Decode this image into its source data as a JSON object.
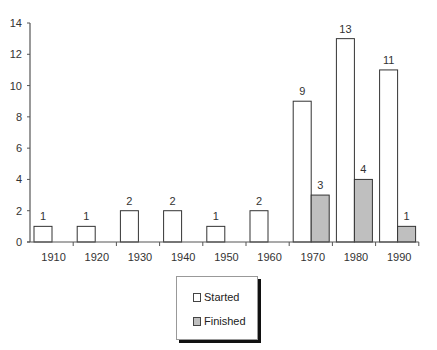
{
  "chart_data": {
    "type": "bar",
    "title": "",
    "xlabel": "",
    "ylabel": "",
    "categories": [
      "1910",
      "1920",
      "1930",
      "1940",
      "1950",
      "1960",
      "1970",
      "1980",
      "1990"
    ],
    "series": [
      {
        "name": "Started",
        "values": [
          1,
          1,
          2,
          2,
          1,
          2,
          9,
          13,
          11
        ],
        "color": "#ffffff"
      },
      {
        "name": "Finished",
        "values": [
          0,
          0,
          0,
          0,
          0,
          0,
          3,
          4,
          1
        ],
        "color": "#bfbfbf"
      }
    ],
    "ylim": [
      0,
      14
    ],
    "yticks": [
      0,
      2,
      4,
      6,
      8,
      10,
      12,
      14
    ],
    "grid": false,
    "legend_position": "bottom-center",
    "data_labels": true
  },
  "legend": {
    "items": [
      {
        "label": "Started",
        "color": "#ffffff"
      },
      {
        "label": "Finished",
        "color": "#bfbfbf"
      }
    ]
  }
}
